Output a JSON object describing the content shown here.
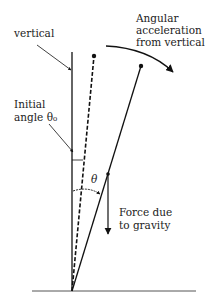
{
  "diagram": {
    "labels": {
      "vertical": "vertical",
      "angular_line1": "Angular",
      "angular_line2": "acceleration",
      "angular_line3": "from vertical",
      "initial_line1": "Initial",
      "initial_line2": "angle θ₀",
      "theta": "θ",
      "force_line1": "Force due",
      "force_line2": "to gravity"
    },
    "colors": {
      "stroke": "#111111",
      "background": "#ffffff"
    }
  }
}
